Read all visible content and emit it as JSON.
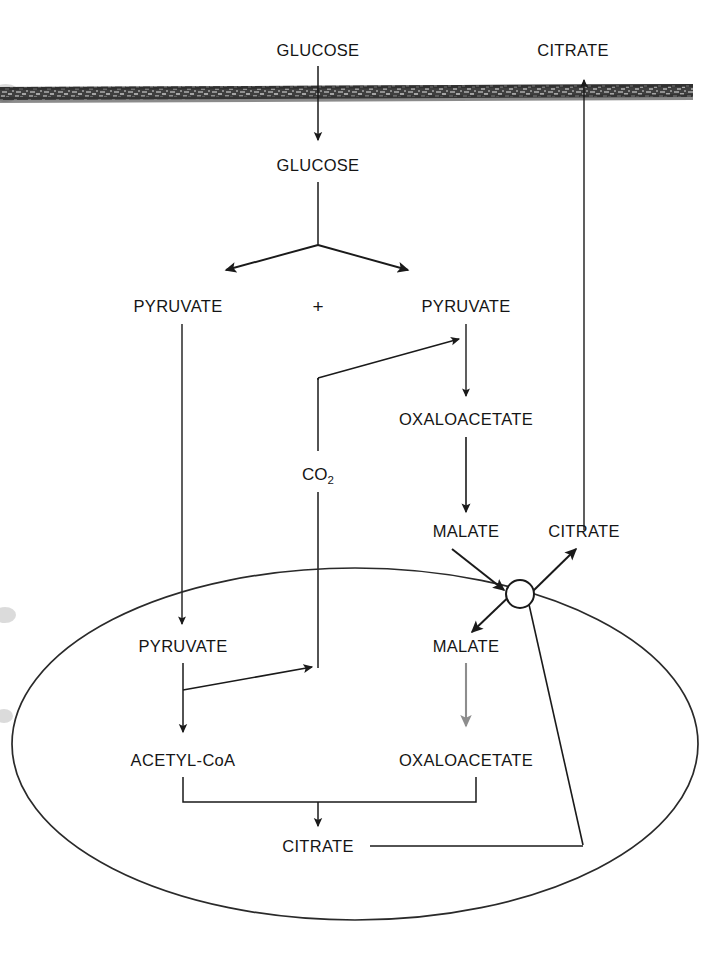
{
  "figure": {
    "colors": {
      "ink": "#1a1a1a",
      "faint_arrow": "#8d8d8d",
      "membrane": "#3b3b3b",
      "background": "#ffffff"
    }
  },
  "labels": {
    "glucose_outside": "GLUCOSE",
    "citrate_outside": "CITRATE",
    "glucose_inside": "GLUCOSE",
    "pyruvate_left": "PYRUVATE",
    "plus_sign": "+",
    "pyruvate_right": "PYRUVATE",
    "co2": "CO",
    "co2_subscript": "2",
    "oxaloacetate_cytosol": "OXALOACETATE",
    "malate_cytosol": "MALATE",
    "citrate_cytosol": "CITRATE",
    "pyruvate_matrix": "PYRUVATE",
    "malate_matrix": "MALATE",
    "acetyl_coa": "ACETYL-CoA",
    "oxaloacetate_matrix": "OXALOACETATE",
    "citrate_matrix": "CITRATE"
  },
  "compartments": {
    "plasma_membrane": "plasma-membrane-band",
    "mitochondrion": "mitochondrion-outline",
    "transporter": "citrate-malate-carrier"
  },
  "edges": [
    {
      "name": "glucose-uptake",
      "from": "glucose_outside",
      "to": "glucose_inside"
    },
    {
      "name": "citrate-efflux",
      "from": "citrate_cytosol",
      "to": "citrate_outside"
    },
    {
      "name": "glycolysis-split-left",
      "from": "glucose_inside",
      "to": "pyruvate_left"
    },
    {
      "name": "glycolysis-split-right",
      "from": "glucose_inside",
      "to": "pyruvate_right"
    },
    {
      "name": "co2-to-pyruvate-carboxylation",
      "from": "co2",
      "to": "pyruvate_right"
    },
    {
      "name": "pyruvate-to-oxaloacetate",
      "from": "pyruvate_right",
      "to": "oxaloacetate_cytosol"
    },
    {
      "name": "oxaloacetate-to-malate",
      "from": "oxaloacetate_cytosol",
      "to": "malate_cytosol"
    },
    {
      "name": "pyruvate-import",
      "from": "pyruvate_left",
      "to": "pyruvate_matrix"
    },
    {
      "name": "pyruvate-to-acetyl-coa",
      "from": "pyruvate_matrix",
      "to": "acetyl_coa"
    },
    {
      "name": "pyruvate-decarboxylation-co2",
      "from": "pyruvate_matrix",
      "to": "co2"
    },
    {
      "name": "malate-import",
      "from": "malate_cytosol",
      "to": "malate_matrix"
    },
    {
      "name": "malate-to-oxaloacetate-matrix",
      "from": "malate_matrix",
      "to": "oxaloacetate_matrix"
    },
    {
      "name": "acetyl-coa-plus-oxaloacetate-to-citrate",
      "from": "acetyl_coa",
      "to": "citrate_matrix"
    },
    {
      "name": "citrate-export",
      "from": "citrate_matrix",
      "to": "citrate_cytosol"
    }
  ]
}
